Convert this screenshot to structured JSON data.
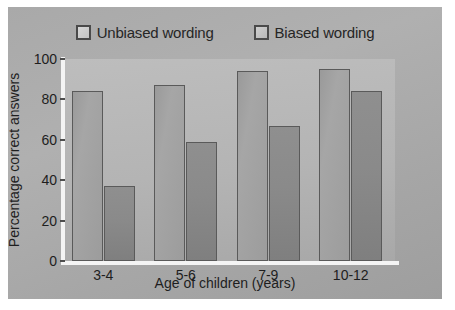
{
  "chart_data": {
    "type": "bar",
    "title": "",
    "xlabel": "Age of children (years)",
    "ylabel": "Percentage correct answers",
    "categories": [
      "3-4",
      "5-6",
      "7-9",
      "10-12"
    ],
    "series": [
      {
        "name": "Unbiased wording",
        "values": [
          84,
          87,
          94,
          95
        ]
      },
      {
        "name": "Biased wording",
        "values": [
          37,
          59,
          67,
          84
        ]
      }
    ],
    "ylim": [
      0,
      100
    ],
    "yticks": [
      0,
      20,
      40,
      60,
      80,
      100
    ],
    "grid": false,
    "legend_position": "top"
  },
  "legend": {
    "entries": [
      {
        "label": "Unbiased wording",
        "swatch": "light-grey-square"
      },
      {
        "label": "Biased wording",
        "swatch": "dark-grey-square"
      }
    ]
  },
  "colors": {
    "figure_background": "#aeaeae",
    "plot_background": "#b4b4b4",
    "axis_line": "#f4f4f4",
    "bar_unbiased": "#a0a0a0",
    "bar_biased": "#888888",
    "bar_border": "#5a5a5a",
    "text": "#1e1e1e"
  }
}
